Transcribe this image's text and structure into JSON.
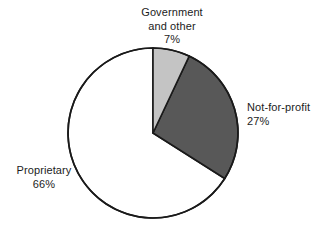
{
  "chart_data": {
    "type": "pie",
    "title": "",
    "subtitle": "",
    "xlabel": "",
    "ylabel": "",
    "legend_position": "none",
    "grid": false,
    "labels_inline": true,
    "start_angle_deg": 0,
    "direction": "clockwise",
    "categories": [
      "Government and other",
      "Not-for-profit",
      "Proprietary"
    ],
    "values": [
      7,
      27,
      66
    ],
    "units": "percent",
    "total": 100,
    "slices": [
      {
        "name": "Government and other",
        "value": 7,
        "value_label": "7%",
        "color": "#c4c4c4",
        "stroke": "#1a1a1a",
        "label_lines": [
          "Government",
          "and other",
          "7%"
        ],
        "label_position": "top"
      },
      {
        "name": "Not-for-profit",
        "value": 27,
        "value_label": "27%",
        "color": "#585858",
        "stroke": "#1a1a1a",
        "label_lines": [
          "Not-for-profit",
          "27%"
        ],
        "label_position": "right"
      },
      {
        "name": "Proprietary",
        "value": 66,
        "value_label": "66%",
        "color": "#ffffff",
        "stroke": "#1a1a1a",
        "label_lines": [
          "Proprietary",
          "66%"
        ],
        "label_position": "left"
      }
    ]
  },
  "labels": {
    "government": {
      "line1": "Government",
      "line2": "and other",
      "line3": "7%"
    },
    "not_for_profit": {
      "line1": "Not-for-profit",
      "line2": "27%"
    },
    "proprietary": {
      "line1": "Proprietary",
      "line2": "66%"
    }
  },
  "colors": {
    "background": "#ffffff",
    "outline": "#1a1a1a",
    "text": "#1c1c1c",
    "slice_light": "#c4c4c4",
    "slice_dark": "#585858",
    "slice_white": "#ffffff"
  }
}
